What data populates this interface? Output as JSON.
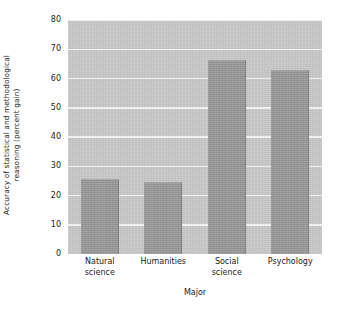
{
  "chart_data": {
    "type": "bar",
    "title": "",
    "xlabel": "Major",
    "ylabel_line1": "Accuracy of statistical and methodological",
    "ylabel_line2": "reasoning (percent gain)",
    "categories": [
      "Natural science",
      "Humanities",
      "Social science",
      "Psychology"
    ],
    "category_lines": [
      [
        "Natural",
        "science"
      ],
      [
        "Humanities"
      ],
      [
        "Social",
        "science"
      ],
      [
        "Psychology"
      ]
    ],
    "values": [
      25.5,
      24.5,
      66.5,
      63
    ],
    "ylim": [
      0,
      80
    ],
    "yticks": [
      0,
      10,
      20,
      30,
      40,
      50,
      60,
      70,
      80
    ],
    "ytick_labels": [
      "0",
      "10",
      "20",
      "30",
      "40",
      "50",
      "60",
      "70",
      "80"
    ],
    "grid": true,
    "legend": "none",
    "colors": {
      "bar_fill": "#9a9a9a",
      "bar_edge": "#7b7b7b",
      "plot_background": "#c9c9c9",
      "gridline": "#f7f7f7",
      "figure_background": "#ffffff",
      "text": "#1a1a1a"
    }
  }
}
